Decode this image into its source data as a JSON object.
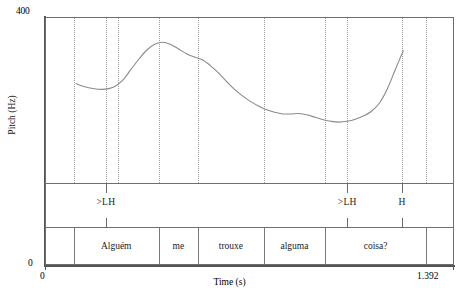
{
  "figure": {
    "type": "pitch-contour",
    "width": 459,
    "height": 296
  },
  "axes": {
    "y_label": "Pitch (Hz)",
    "y_max_tick": "400",
    "y_min_tick": "0",
    "x_label": "Time (s)",
    "x_min_tick": "0",
    "x_max_tick": "1.392"
  },
  "tone_tier": {
    "labels": [
      {
        "text": ">LH",
        "time": 0.205
      },
      {
        "text": ">LH",
        "time": 1.03
      },
      {
        "text": "H",
        "time": 1.218
      }
    ]
  },
  "word_tier": {
    "words": [
      {
        "text": "",
        "start": 0.0,
        "end": 0.095
      },
      {
        "text": "Alguém",
        "start": 0.095,
        "end": 0.385
      },
      {
        "text": "me",
        "start": 0.385,
        "end": 0.52
      },
      {
        "text": "trouxe",
        "start": 0.52,
        "end": 0.745
      },
      {
        "text": "alguma",
        "start": 0.745,
        "end": 0.955
      },
      {
        "text": "coisa?",
        "start": 0.955,
        "end": 1.3
      },
      {
        "text": "",
        "start": 1.3,
        "end": 1.392
      }
    ]
  },
  "chart_data": {
    "type": "line",
    "title": "",
    "xlabel": "Time (s)",
    "ylabel": "Pitch (Hz)",
    "xlim": [
      0,
      1.392
    ],
    "ylim": [
      0,
      400
    ],
    "grid": true,
    "legend": null,
    "series": [
      {
        "name": "F0 contour",
        "color": "#8a8a8a",
        "x": [
          0.103,
          0.13,
          0.16,
          0.195,
          0.23,
          0.262,
          0.29,
          0.318,
          0.345,
          0.372,
          0.398,
          0.425,
          0.452,
          0.48,
          0.508,
          0.535,
          0.562,
          0.59,
          0.618,
          0.645,
          0.672,
          0.7,
          0.728,
          0.755,
          0.782,
          0.81,
          0.838,
          0.865,
          0.892,
          0.92,
          0.948,
          0.975,
          1.002,
          1.03,
          1.058,
          1.085,
          1.112,
          1.14,
          1.168,
          1.195,
          1.222
        ],
        "y": [
          240,
          233,
          228,
          226,
          231,
          248,
          274,
          300,
          322,
          336,
          341,
          336,
          325,
          313,
          305,
          298,
          284,
          266,
          245,
          226,
          210,
          196,
          185,
          176,
          170,
          166,
          166,
          167,
          164,
          158,
          152,
          148,
          146,
          148,
          153,
          161,
          172,
          192,
          228,
          275,
          320
        ]
      }
    ],
    "gridlines_x": [
      0.095,
      0.205,
      0.245,
      0.385,
      0.52,
      0.745,
      0.955,
      1.03,
      1.218,
      1.3
    ]
  }
}
